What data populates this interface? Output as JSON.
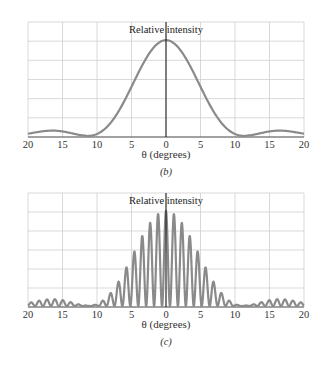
{
  "chart_data": [
    {
      "type": "line",
      "panel": "b",
      "title": "",
      "caption": "(b)",
      "ylabel": "Relative intensity",
      "xlabel": "θ (degrees)",
      "xlim": [
        -20,
        20
      ],
      "ylim": [
        0,
        1.2
      ],
      "x_tick_labels": [
        "20",
        "15",
        "10",
        "5",
        "0",
        "5",
        "10",
        "15",
        "20"
      ],
      "x_ticks": [
        -20,
        -15,
        -10,
        -5,
        0,
        5,
        10,
        15,
        20
      ],
      "grid": true,
      "description": "Single-slit diffraction envelope: central maximum at 0°, first minima near ±11.5°, small secondary maxima near ±16.5°",
      "series": [
        {
          "name": "Relative intensity",
          "x": [
            -20,
            -18,
            -16.5,
            -15,
            -13,
            -11.5,
            -10,
            -8,
            -6,
            -4,
            -2,
            0,
            2,
            4,
            6,
            8,
            10,
            11.5,
            13,
            15,
            16.5,
            18,
            20
          ],
          "values": [
            0.02,
            0.045,
            0.05,
            0.035,
            0.01,
            0.0,
            0.02,
            0.12,
            0.35,
            0.65,
            0.9,
            1.0,
            0.9,
            0.65,
            0.35,
            0.12,
            0.02,
            0.0,
            0.01,
            0.035,
            0.05,
            0.045,
            0.02
          ]
        }
      ]
    },
    {
      "type": "line",
      "panel": "c",
      "title": "",
      "caption": "(c)",
      "ylabel": "Relative intensity",
      "xlabel": "θ (degrees)",
      "xlim": [
        -20,
        20
      ],
      "ylim": [
        0,
        1.2
      ],
      "x_tick_labels": [
        "20",
        "15",
        "10",
        "5",
        "0",
        "5",
        "10",
        "15",
        "20"
      ],
      "x_ticks": [
        -20,
        -15,
        -10,
        -5,
        0,
        5,
        10,
        15,
        20
      ],
      "grid": true,
      "description": "Double-slit interference fringes (period ≈1.15°) modulated by the single-slit envelope of panel (b)",
      "fringe_period_deg": 1.15,
      "series": [
        {
          "name": "Fringe peak heights (envelope)",
          "x": [
            0,
            1.15,
            2.3,
            3.45,
            4.6,
            5.75,
            6.9,
            8.05,
            9.2,
            10.35,
            15.0,
            16.1,
            17.25,
            18.4,
            19.55
          ],
          "values": [
            1.0,
            0.96,
            0.88,
            0.76,
            0.6,
            0.43,
            0.27,
            0.15,
            0.07,
            0.02,
            0.03,
            0.045,
            0.05,
            0.045,
            0.035
          ]
        }
      ]
    }
  ],
  "figure": {
    "panel_b": {
      "ylabel": "Relative intensity",
      "xlabel": "θ (degrees)",
      "caption": "(b)",
      "ticks": [
        "20",
        "15",
        "10",
        "5",
        "0",
        "5",
        "10",
        "15",
        "20"
      ]
    },
    "panel_c": {
      "ylabel": "Relative intensity",
      "xlabel": "θ (degrees)",
      "caption": "(c)",
      "ticks": [
        "20",
        "15",
        "10",
        "5",
        "0",
        "5",
        "10",
        "15",
        "20"
      ]
    },
    "colors": {
      "curve": "#8a8a8a",
      "grid": "#cfcfcf",
      "axis": "#111111"
    }
  }
}
